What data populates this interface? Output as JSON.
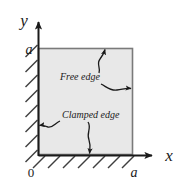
{
  "figure": {
    "type": "engineering-diagram",
    "width": 181,
    "height": 190
  },
  "axes": {
    "x_label": "x",
    "y_label": "y",
    "origin_label": "0",
    "x_tick_label": "a",
    "y_tick_label": "a",
    "axis_color": "#1a1a1a"
  },
  "plate": {
    "fill_color": "#e8e8e8",
    "border_color": "#6b6b6b",
    "x0": 0,
    "y0": 0,
    "x1": "a",
    "y1": "a"
  },
  "annotations": [
    {
      "id": "free-edge",
      "label": "Free edge",
      "targets": [
        "top-edge",
        "right-edge"
      ]
    },
    {
      "id": "clamped-edge",
      "label": "Clamped edge",
      "targets": [
        "left-edge",
        "bottom-edge"
      ]
    }
  ],
  "hatching": {
    "edges": [
      "left",
      "bottom"
    ],
    "angle_degrees": 45,
    "color": "#4a4a4a"
  }
}
